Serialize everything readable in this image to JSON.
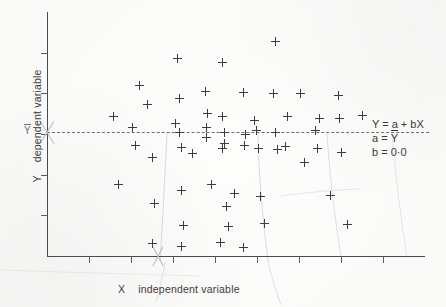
{
  "figure": {
    "axes": {
      "x_label_symbol": "X",
      "x_label_text": "independent variable",
      "y_label_symbol": "Y",
      "y_label_text": "dependent variable",
      "y_mean_tick_label": "Y",
      "x_tick_count": 8,
      "y_tick_count": 5
    },
    "equation": {
      "line1_prefix": "Y = a + b",
      "line1_suffix": "X",
      "line2_lhs": "a = ",
      "line2_rhs": "Y",
      "line3": "b = 0·0"
    },
    "colors": {
      "ink": "#3d3d3d",
      "axis": "#4a4a4a",
      "regression_line": "#6f6f6f",
      "pencil_mark": "#b9b9b9",
      "paper": "#fdfdfc"
    }
  },
  "chart_data": {
    "type": "scatter",
    "title": "",
    "xlabel": "X   independent variable",
    "ylabel": "Y   dependent variable",
    "xlim": [
      0,
      100
    ],
    "ylim": [
      0,
      100
    ],
    "grid": false,
    "legend": null,
    "marker": "+",
    "annotations": [
      {
        "text": "Y = a + bX",
        "x": 86,
        "y": 55
      },
      {
        "text": "a = Ȳ",
        "x": 86,
        "y": 49
      },
      {
        "text": "b = 0·0",
        "x": 86,
        "y": 43
      }
    ],
    "fit_line": {
      "type": "horizontal",
      "equation": "Y = a + bX",
      "intercept_label": "a = Ȳ",
      "slope": 0.0,
      "y": 51.0,
      "style": "dashed"
    },
    "points": [
      {
        "x": 17.6,
        "y": 57.0
      },
      {
        "x": 22.5,
        "y": 52.5
      },
      {
        "x": 24.5,
        "y": 70.0
      },
      {
        "x": 23.5,
        "y": 45.5
      },
      {
        "x": 18.8,
        "y": 29.5
      },
      {
        "x": 26.5,
        "y": 62.0
      },
      {
        "x": 28.0,
        "y": 40.5
      },
      {
        "x": 28.3,
        "y": 21.5
      },
      {
        "x": 34.5,
        "y": 81.0
      },
      {
        "x": 35.0,
        "y": 64.5
      },
      {
        "x": 35.0,
        "y": 50.5
      },
      {
        "x": 34.0,
        "y": 54.5
      },
      {
        "x": 35.5,
        "y": 44.5
      },
      {
        "x": 35.5,
        "y": 27.0
      },
      {
        "x": 36.0,
        "y": 12.5
      },
      {
        "x": 38.5,
        "y": 42.0
      },
      {
        "x": 42.0,
        "y": 67.5
      },
      {
        "x": 42.5,
        "y": 58.5
      },
      {
        "x": 42.3,
        "y": 52.5
      },
      {
        "x": 42.2,
        "y": 48.5
      },
      {
        "x": 43.5,
        "y": 29.5
      },
      {
        "x": 46.5,
        "y": 79.5
      },
      {
        "x": 46.5,
        "y": 57.0
      },
      {
        "x": 47.0,
        "y": 50.5
      },
      {
        "x": 47.0,
        "y": 46.0
      },
      {
        "x": 46.5,
        "y": 44.0
      },
      {
        "x": 47.5,
        "y": 20.5
      },
      {
        "x": 48.0,
        "y": 12.0
      },
      {
        "x": 49.5,
        "y": 25.5
      },
      {
        "x": 52.0,
        "y": 67.0
      },
      {
        "x": 52.5,
        "y": 50.0
      },
      {
        "x": 52.2,
        "y": 45.5
      },
      {
        "x": 55.0,
        "y": 55.5
      },
      {
        "x": 55.5,
        "y": 51.5
      },
      {
        "x": 56.0,
        "y": 44.0
      },
      {
        "x": 56.5,
        "y": 24.5
      },
      {
        "x": 57.5,
        "y": 13.5
      },
      {
        "x": 60.5,
        "y": 88.0
      },
      {
        "x": 60.0,
        "y": 66.5
      },
      {
        "x": 60.5,
        "y": 50.5
      },
      {
        "x": 61.0,
        "y": 43.5
      },
      {
        "x": 63.5,
        "y": 57.0
      },
      {
        "x": 63.2,
        "y": 45.0
      },
      {
        "x": 67.0,
        "y": 66.5
      },
      {
        "x": 68.0,
        "y": 38.5
      },
      {
        "x": 71.0,
        "y": 51.5
      },
      {
        "x": 71.5,
        "y": 44.0
      },
      {
        "x": 72.0,
        "y": 56.5
      },
      {
        "x": 75.0,
        "y": 25.0
      },
      {
        "x": 77.0,
        "y": 66.0
      },
      {
        "x": 77.5,
        "y": 56.5
      },
      {
        "x": 78.0,
        "y": 42.5
      },
      {
        "x": 79.5,
        "y": 13.0
      },
      {
        "x": 83.5,
        "y": 57.5
      },
      {
        "x": 28.0,
        "y": 5.0
      },
      {
        "x": 35.5,
        "y": 4.0
      },
      {
        "x": 46.0,
        "y": 5.5
      },
      {
        "x": 52.0,
        "y": 3.5
      }
    ]
  }
}
